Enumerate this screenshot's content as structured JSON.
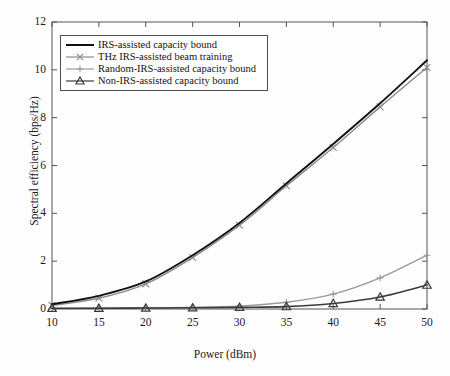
{
  "chart_data": {
    "type": "line",
    "title": "",
    "xlabel": "Power (dBm)",
    "ylabel": "Spectral efficiency (bps/Hz)",
    "x": [
      10,
      15,
      20,
      25,
      30,
      35,
      40,
      45,
      50
    ],
    "xlim": [
      10,
      50
    ],
    "ylim": [
      0,
      12
    ],
    "xticks": [
      "10",
      "15",
      "20",
      "25",
      "30",
      "35",
      "40",
      "45",
      "50"
    ],
    "yticks": [
      "0",
      "2",
      "4",
      "6",
      "8",
      "10",
      "12"
    ],
    "grid": false,
    "legend_position": "upper-left",
    "series": [
      {
        "name": "IRS-assisted capacity bound",
        "marker": "none",
        "color": "#111111",
        "values": [
          0.2,
          0.55,
          1.15,
          2.25,
          3.6,
          5.25,
          6.9,
          8.6,
          10.4
        ]
      },
      {
        "name": "THz IRS-assisted beam training",
        "marker": "x",
        "color": "#8a8a8a",
        "values": [
          0.15,
          0.45,
          1.05,
          2.15,
          3.5,
          5.15,
          6.75,
          8.45,
          10.1
        ]
      },
      {
        "name": "Random-IRS-assisted capacity bound",
        "marker": "plus",
        "color": "#9a9a9a",
        "values": [
          0.02,
          0.03,
          0.05,
          0.07,
          0.12,
          0.28,
          0.62,
          1.3,
          2.25
        ]
      },
      {
        "name": "Non-IRS-assisted capacity bound",
        "marker": "triangle",
        "color": "#3a3a3a",
        "values": [
          0.03,
          0.03,
          0.04,
          0.05,
          0.07,
          0.1,
          0.23,
          0.5,
          1.0
        ]
      }
    ]
  },
  "axes": {
    "box_color": "#555555"
  }
}
